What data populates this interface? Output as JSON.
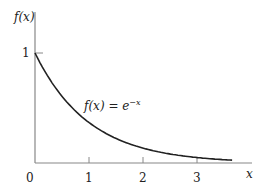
{
  "chart_data": {
    "type": "line",
    "title": "",
    "xlabel": "x",
    "ylabel": "f(x)",
    "annotation": "f(x) = e^{-x}",
    "annotation_parts": {
      "lhs": "f(x) = e",
      "sup": "−x"
    },
    "x_ticks": [
      "0",
      "1",
      "2",
      "3"
    ],
    "y_ticks": [
      "1"
    ],
    "xlim": [
      0,
      3.9
    ],
    "ylim": [
      0,
      1.3
    ],
    "grid": false,
    "legend": "none",
    "series": [
      {
        "name": "f(x) = e^-x",
        "x": [
          0,
          0.25,
          0.5,
          0.75,
          1,
          1.25,
          1.5,
          1.75,
          2,
          2.25,
          2.5,
          2.75,
          3,
          3.25,
          3.5,
          3.65
        ],
        "values": [
          1.0,
          0.779,
          0.607,
          0.472,
          0.368,
          0.287,
          0.223,
          0.174,
          0.135,
          0.105,
          0.082,
          0.064,
          0.05,
          0.039,
          0.03,
          0.026
        ]
      }
    ],
    "colors": {
      "curve": "#222222",
      "axis": "#888888"
    }
  }
}
